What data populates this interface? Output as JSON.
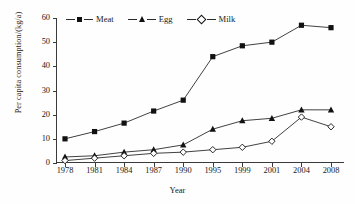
{
  "chart_data": {
    "type": "line",
    "title": "",
    "xlabel": "Year",
    "ylabel": "Per capita consumption/(kg/a)",
    "categories": [
      "1978",
      "1981",
      "1984",
      "1987",
      "1990",
      "1995",
      "1999",
      "2001",
      "2004",
      "2008"
    ],
    "ylim": [
      0,
      60
    ],
    "yticks": [
      0,
      10,
      20,
      30,
      40,
      50,
      60
    ],
    "grid": false,
    "legend_position": "top-left",
    "series": [
      {
        "name": "Meat",
        "marker": "filled-square",
        "values": [
          10,
          13,
          16.5,
          21.5,
          26,
          44,
          48.5,
          50,
          57,
          56
        ]
      },
      {
        "name": "Egg",
        "marker": "filled-triangle",
        "values": [
          2.5,
          3,
          4.5,
          5.5,
          7.5,
          14,
          17.5,
          18.5,
          22,
          22
        ]
      },
      {
        "name": "Milk",
        "marker": "open-diamond",
        "values": [
          1,
          2,
          3,
          4,
          4.5,
          5.5,
          6.5,
          9,
          19,
          15
        ]
      }
    ]
  },
  "legend": {
    "items": [
      {
        "label": "Meat"
      },
      {
        "label": "Egg"
      },
      {
        "label": "Milk"
      }
    ]
  },
  "axes": {
    "x_title": "Year",
    "y_title": "Per capita consumption/(kg/a)"
  }
}
